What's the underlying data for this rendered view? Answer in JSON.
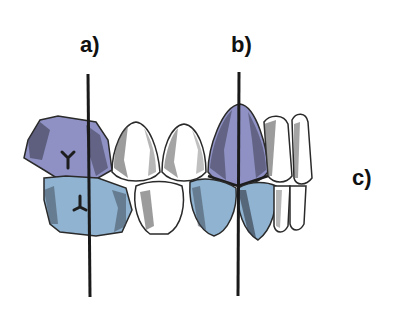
{
  "diagram": {
    "labels": {
      "a": "a)",
      "b": "b)",
      "c": "c)"
    },
    "colors": {
      "upper_tooth": "#8f91c4",
      "lower_tooth": "#8fb3d0",
      "outline": "#2a2a2a",
      "shading": "#4a4a4a",
      "white_tooth": "#ffffff",
      "axis_line": "#1a1a1a"
    },
    "elements": [
      "axis line a through molar",
      "axis line b through premolar",
      "upper molar (purple) with Y-shaped fissure",
      "lower molar (blue) with inverted Y fissure",
      "two white premolars (upper and lower)",
      "upper premolar purple, lower premolar blue",
      "side-view teeth sequence on right (c)"
    ]
  }
}
